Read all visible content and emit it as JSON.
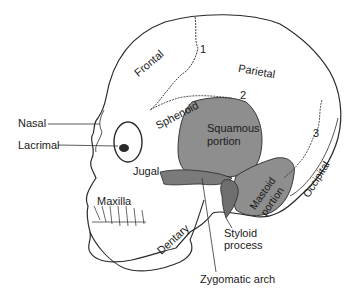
{
  "figure": {
    "colors": {
      "background": "#ffffff",
      "outline": "#2a2a2a",
      "temporal_fill": "#8e8e8e",
      "label_text": "#1a1a1a",
      "leader_line": "#333333"
    },
    "labels": {
      "frontal": "Frontal",
      "parietal": "Parietal",
      "sphenoid": "Sphenoid",
      "squamous_line1": "Squamous",
      "squamous_line2": "portion",
      "nasal": "Nasal",
      "lacrimal": "Lacrimal",
      "jugal": "Jugal",
      "maxilla": "Maxilla",
      "dentary": "Dentary",
      "mastoid_line1": "Mastoid",
      "mastoid_line2": "portion",
      "occipital": "Occipital",
      "styloid_line1": "Styloid",
      "styloid_line2": "process",
      "zygomatic_arch": "Zygomatic arch"
    },
    "suture_numbers": {
      "one": "1",
      "two": "2",
      "three": "3"
    }
  }
}
